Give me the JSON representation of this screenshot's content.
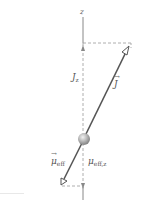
{
  "diagram": {
    "type": "vector-diagram",
    "axis": {
      "label": "z"
    },
    "vectors": [
      {
        "name": "J",
        "label": "J",
        "direction": "up-right",
        "component_label": "J",
        "component_sub": "z"
      },
      {
        "name": "mu_eff",
        "label": "μ",
        "label_sub": "eff",
        "direction": "down-left",
        "component_label": "μ",
        "component_sub": "eff,z"
      }
    ],
    "colors": {
      "vector_line": "#555555",
      "axis_line": "#888888",
      "dashed": "#999999",
      "sphere": "#b0b0b0"
    }
  }
}
